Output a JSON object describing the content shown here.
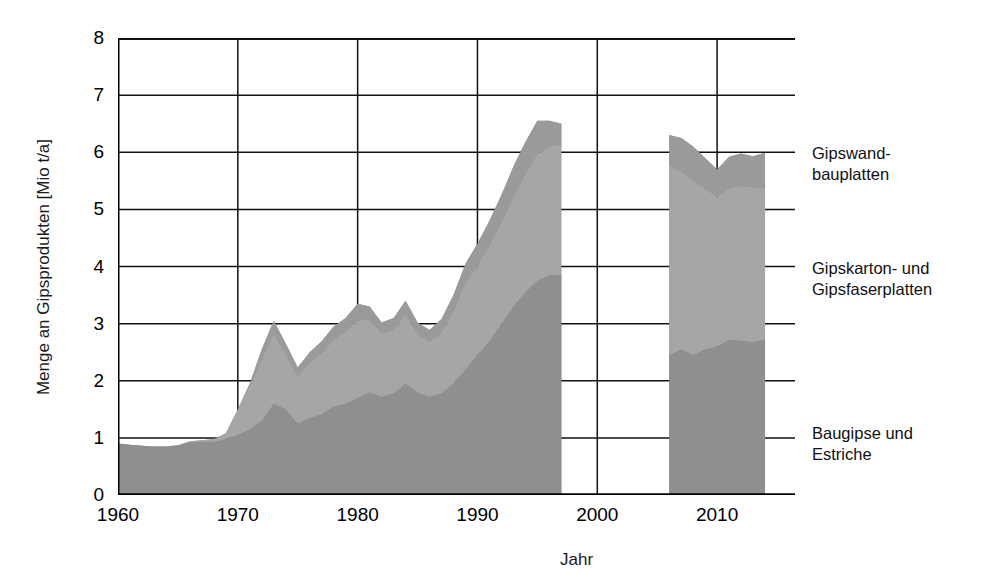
{
  "chart_data": {
    "type": "area",
    "title": "",
    "xlabel": "Jahr",
    "ylabel": "Menge an Gipsprodukten [Mio t/a]",
    "xlim": [
      1960,
      2016.5
    ],
    "ylim": [
      0,
      8
    ],
    "xticks": [
      1960,
      1970,
      1980,
      1990,
      2000,
      2010
    ],
    "yticks": [
      0,
      1,
      2,
      3,
      4,
      5,
      6,
      7,
      8
    ],
    "grid": true,
    "stacked": true,
    "legend_position": "right",
    "gap_years": [
      1998,
      2005
    ],
    "colors": {
      "baugipse_und_estriche": "#8f8f8f",
      "gipskarton_und_gipsfaserplatten": "#a6a6a6",
      "gipswandbauplatten": "#9a9a9a",
      "axis": "#000000",
      "text": "#111111"
    },
    "x": [
      1960,
      1961,
      1962,
      1963,
      1964,
      1965,
      1966,
      1967,
      1968,
      1969,
      1970,
      1971,
      1972,
      1973,
      1974,
      1975,
      1976,
      1977,
      1978,
      1979,
      1980,
      1981,
      1982,
      1983,
      1984,
      1985,
      1986,
      1987,
      1988,
      1989,
      1990,
      1991,
      1992,
      1993,
      1994,
      1995,
      1996,
      1997,
      2006,
      2007,
      2008,
      2009,
      2010,
      2011,
      2012,
      2013,
      2014
    ],
    "series": [
      {
        "name": "Baugipse und Estriche",
        "values": [
          0.9,
          0.88,
          0.86,
          0.85,
          0.85,
          0.87,
          0.92,
          0.93,
          0.93,
          0.98,
          1.05,
          1.15,
          1.3,
          1.6,
          1.5,
          1.25,
          1.35,
          1.42,
          1.55,
          1.6,
          1.7,
          1.8,
          1.72,
          1.78,
          1.95,
          1.8,
          1.72,
          1.78,
          1.95,
          2.2,
          2.45,
          2.7,
          3.0,
          3.3,
          3.55,
          3.75,
          3.85,
          3.85,
          2.45,
          2.55,
          2.45,
          2.55,
          2.6,
          2.72,
          2.7,
          2.68,
          2.72
        ]
      },
      {
        "name": "Gipskarton- und Gipsfaserplatten",
        "values": [
          0.0,
          0.0,
          0.0,
          0.0,
          0.0,
          0.0,
          0.02,
          0.03,
          0.05,
          0.1,
          0.45,
          0.75,
          1.05,
          1.2,
          0.95,
          0.8,
          0.95,
          1.05,
          1.15,
          1.25,
          1.35,
          1.25,
          1.1,
          1.1,
          1.2,
          1.0,
          0.95,
          1.05,
          1.25,
          1.5,
          1.55,
          1.65,
          1.75,
          1.9,
          2.05,
          2.2,
          2.25,
          2.25,
          3.3,
          3.1,
          3.05,
          2.8,
          2.6,
          2.65,
          2.7,
          2.7,
          2.65
        ]
      },
      {
        "name": "Gipswandbauplatten",
        "values": [
          0.0,
          0.0,
          0.0,
          0.0,
          0.0,
          0.0,
          0.0,
          0.0,
          0.0,
          0.0,
          0.0,
          0.05,
          0.2,
          0.25,
          0.2,
          0.18,
          0.2,
          0.22,
          0.25,
          0.25,
          0.3,
          0.25,
          0.2,
          0.22,
          0.25,
          0.22,
          0.22,
          0.25,
          0.3,
          0.35,
          0.4,
          0.45,
          0.5,
          0.55,
          0.58,
          0.6,
          0.45,
          0.4,
          0.55,
          0.6,
          0.6,
          0.55,
          0.5,
          0.55,
          0.58,
          0.55,
          0.62
        ]
      }
    ]
  },
  "axes": {
    "y_ticks": [
      "0",
      "1",
      "2",
      "3",
      "4",
      "5",
      "6",
      "7",
      "8"
    ],
    "x_ticks": [
      "1960",
      "1970",
      "1980",
      "1990",
      "2000",
      "2010"
    ],
    "y_title": "Menge an Gipsprodukten [Mio t/a]",
    "x_title": "Jahr"
  },
  "legend": {
    "items": [
      {
        "label_line1": "Gipswand-",
        "label_line2": "bauplatten"
      },
      {
        "label_line1": "Gipskarton- und",
        "label_line2": "Gipsfaserplatten"
      },
      {
        "label_line1": "Baugipse und",
        "label_line2": "Estriche"
      }
    ]
  }
}
